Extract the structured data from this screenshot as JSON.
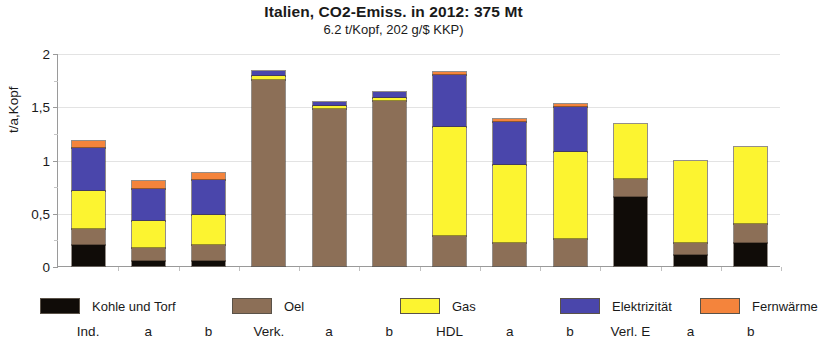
{
  "title": {
    "main": "Italien, CO2-Emiss. in 2012: 375 Mt",
    "sub": "6.2  t/Kopf,  202 g/$ KKP)"
  },
  "colors": {
    "kohle": "#100c08",
    "oel": "#8c6f57",
    "gas": "#fcf430",
    "elektrizitaet": "#4a46ab",
    "fernwaerme": "#f4843c",
    "axis": "#9a9a9a",
    "grid": "#e3e3e3"
  },
  "legend": [
    {
      "key": "kohle",
      "label": "Kohle und Torf",
      "color": "#100c08"
    },
    {
      "key": "oel",
      "label": "Oel",
      "color": "#8c6f57"
    },
    {
      "key": "gas",
      "label": "Gas",
      "color": "#fcf430"
    },
    {
      "key": "elektrizitaet",
      "label": "Elektrizität",
      "color": "#4a46ab"
    },
    {
      "key": "fernwaerme",
      "label": "Fernwärme",
      "color": "#f4843c"
    }
  ],
  "chart_data": {
    "type": "bar",
    "subtype": "stacked",
    "title": "Italien, CO2-Emiss. in 2012: 375 Mt",
    "subtitle": "6.2  t/Kopf,  202 g/$ KKP)",
    "xlabel": "",
    "ylabel": "t/a,Kopf",
    "ylim": [
      0,
      2
    ],
    "yticks": [
      0,
      0.5,
      1,
      1.5,
      2
    ],
    "ytick_labels": [
      "0",
      "0,5",
      "1",
      "1,5",
      "2"
    ],
    "ytick_minor": [
      0.25,
      0.75,
      1.25,
      1.75
    ],
    "grid": true,
    "legend_position": "bottom",
    "categories": [
      "Ind.",
      "a",
      "b",
      "Verk.",
      "a",
      "b",
      "HDL",
      "a",
      "b",
      "Verl. E",
      "a",
      "b"
    ],
    "series": [
      {
        "name": "Kohle und Torf",
        "color": "#100c08",
        "values": [
          0.2,
          0.05,
          0.05,
          0.0,
          0.0,
          0.0,
          0.0,
          0.0,
          0.0,
          0.65,
          0.1,
          0.22
        ]
      },
      {
        "name": "Oel",
        "color": "#8c6f57",
        "values": [
          0.15,
          0.12,
          0.15,
          1.75,
          1.47,
          1.55,
          0.28,
          0.22,
          0.25,
          0.17,
          0.12,
          0.17
        ]
      },
      {
        "name": "Gas",
        "color": "#fcf430",
        "values": [
          0.35,
          0.25,
          0.28,
          0.03,
          0.03,
          0.03,
          1.03,
          0.73,
          0.82,
          0.51,
          0.77,
          0.73
        ]
      },
      {
        "name": "Elektrizität",
        "color": "#4a46ab",
        "values": [
          0.41,
          0.3,
          0.33,
          0.05,
          0.04,
          0.05,
          0.48,
          0.4,
          0.42,
          0.0,
          0.0,
          0.0
        ]
      },
      {
        "name": "Fernwärme",
        "color": "#f4843c",
        "values": [
          0.06,
          0.08,
          0.06,
          0.0,
          0.0,
          0.0,
          0.03,
          0.03,
          0.03,
          0.0,
          0.0,
          0.0
        ]
      }
    ],
    "totals": [
      1.17,
      0.8,
      0.87,
      1.83,
      1.54,
      1.63,
      1.82,
      1.38,
      1.52,
      1.33,
      0.99,
      1.12
    ]
  }
}
